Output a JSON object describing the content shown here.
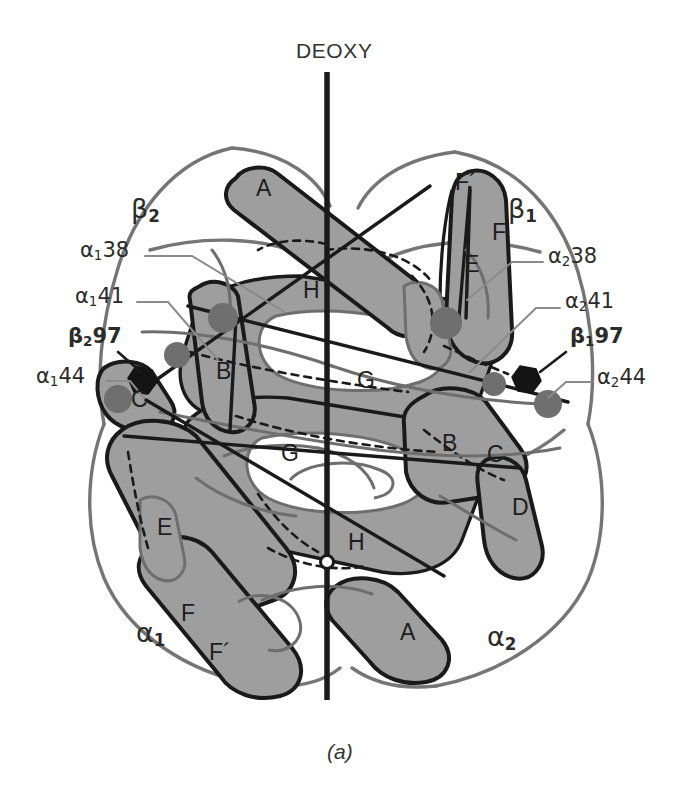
{
  "figure": {
    "title": "DEOXY",
    "caption": "(a)",
    "axis_label": "molecular-dyad-axis",
    "colors": {
      "subunit_fill": "#9e9e9e",
      "subunit_outline": "#1a1a1a",
      "secondary_outline": "#6e6e6e",
      "heme_marker": "#6f6f6f",
      "residue_marker": "#141414",
      "background": "#ffffff",
      "text": "#2b2b2b",
      "leader_line": "#8a8a8a"
    }
  },
  "chain_labels": [
    {
      "id": "beta2",
      "base": "β",
      "sub": "2",
      "x": 131,
      "y": 211
    },
    {
      "id": "beta1",
      "base": "β",
      "sub": "1",
      "x": 508,
      "y": 211
    },
    {
      "id": "alpha1",
      "base": "α",
      "sub": "1",
      "x": 136,
      "y": 633
    },
    {
      "id": "alpha2",
      "base": "α",
      "sub": "2",
      "x": 487,
      "y": 637
    }
  ],
  "residue_labels": [
    {
      "id": "a1-38",
      "base": "α",
      "sub": "1",
      "num": "38",
      "x": 80,
      "y": 252
    },
    {
      "id": "a1-41",
      "base": "α",
      "sub": "1",
      "num": "41",
      "x": 75,
      "y": 298
    },
    {
      "id": "b2-97",
      "base": "β",
      "sub": "2",
      "num": "97",
      "x": 68,
      "y": 340
    },
    {
      "id": "a1-44",
      "base": "α",
      "sub": "1",
      "num": "44",
      "x": 36,
      "y": 378
    },
    {
      "id": "a2-38",
      "base": "α",
      "sub": "2",
      "num": "38",
      "x": 548,
      "y": 258
    },
    {
      "id": "a2-41",
      "base": "α",
      "sub": "2",
      "num": "41",
      "x": 565,
      "y": 303
    },
    {
      "id": "b1-97",
      "base": "β",
      "sub": "1",
      "num": "97",
      "x": 570,
      "y": 340
    },
    {
      "id": "a2-44",
      "base": "α",
      "sub": "2",
      "num": "44",
      "x": 597,
      "y": 379
    }
  ],
  "helix_labels": [
    {
      "id": "b2-A",
      "text": "A",
      "x": 256,
      "y": 189
    },
    {
      "id": "b1-Fp",
      "text": "F´",
      "x": 455,
      "y": 183
    },
    {
      "id": "b1-F",
      "text": "F",
      "x": 492,
      "y": 233
    },
    {
      "id": "b1-E",
      "text": "E",
      "x": 464,
      "y": 265
    },
    {
      "id": "a-H",
      "text": "H",
      "x": 303,
      "y": 291
    },
    {
      "id": "b2-B",
      "text": "B",
      "x": 216,
      "y": 372
    },
    {
      "id": "a-G",
      "text": "G",
      "x": 357,
      "y": 381
    },
    {
      "id": "b2-C",
      "text": "C",
      "x": 131,
      "y": 400
    },
    {
      "id": "a-G2",
      "text": "G",
      "x": 281,
      "y": 454
    },
    {
      "id": "b1-B",
      "text": "B",
      "x": 442,
      "y": 444
    },
    {
      "id": "b1-C",
      "text": "C",
      "x": 487,
      "y": 455
    },
    {
      "id": "b1-D",
      "text": "D",
      "x": 512,
      "y": 508
    },
    {
      "id": "a1-E",
      "text": "E",
      "x": 157,
      "y": 528
    },
    {
      "id": "a-H2",
      "text": "H",
      "x": 348,
      "y": 543
    },
    {
      "id": "a1-F",
      "text": "F",
      "x": 181,
      "y": 614
    },
    {
      "id": "a1-Fp",
      "text": "F´",
      "x": 209,
      "y": 653
    },
    {
      "id": "a2-A",
      "text": "A",
      "x": 400,
      "y": 633
    }
  ],
  "heme_markers": [
    {
      "id": "heme-b2-upper",
      "x": 223,
      "y": 318,
      "r": 15
    },
    {
      "id": "heme-b2-lower",
      "x": 177,
      "y": 355,
      "r": 13
    },
    {
      "id": "heme-b2-c",
      "x": 118,
      "y": 399,
      "r": 14
    },
    {
      "id": "heme-b1-upper",
      "x": 446,
      "y": 323,
      "r": 16
    },
    {
      "id": "heme-b1-lower",
      "x": 494,
      "y": 384,
      "r": 12
    },
    {
      "id": "heme-b1-c",
      "x": 548,
      "y": 404,
      "r": 14
    }
  ],
  "residue_markers": [
    {
      "id": "marker-b2-97",
      "x": 143,
      "y": 380
    },
    {
      "id": "marker-b1-97",
      "x": 527,
      "y": 379
    }
  ],
  "leader_lines": [
    {
      "id": "leader-a1-38",
      "points": "145,256 192,256 283,311"
    },
    {
      "id": "leader-a1-41",
      "points": "137,302 168,302 218,360"
    },
    {
      "id": "leader-b2-97",
      "points": "118,352 141,374"
    },
    {
      "id": "leader-a1-44",
      "points": "107,381 130,381 146,400"
    },
    {
      "id": "leader-a2-38",
      "points": "543,262 512,262 467,300"
    },
    {
      "id": "leader-a2-41",
      "points": "560,308 536,308 470,372"
    },
    {
      "id": "leader-b1-97",
      "points": "566,352 538,372"
    },
    {
      "id": "leader-a2-44",
      "points": "592,382 566,382 546,398"
    }
  ]
}
